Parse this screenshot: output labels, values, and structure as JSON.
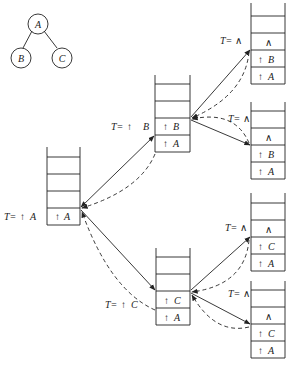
{
  "tree": {
    "nodes": [
      {
        "id": "A",
        "label": "A"
      },
      {
        "id": "B",
        "label": "B"
      },
      {
        "id": "C",
        "label": "C"
      }
    ],
    "edges": [
      [
        "A",
        "B"
      ],
      [
        "A",
        "C"
      ]
    ]
  },
  "stacks": [
    {
      "id": "s1",
      "label": "T=↑ A",
      "cells": [
        "↑ A"
      ]
    },
    {
      "id": "s2",
      "label": "T=↑ B",
      "cells": [
        "↑ A",
        "↑ B"
      ]
    },
    {
      "id": "s3",
      "label": "T=∧",
      "cells": [
        "↑ A",
        "↑ B",
        "∧"
      ]
    },
    {
      "id": "s4",
      "label": "T=∧",
      "cells": [
        "↑ A",
        "↑ B",
        "∧"
      ]
    },
    {
      "id": "s5",
      "label": "T=∧",
      "cells": [
        "↑ A",
        "↑ C",
        "∧"
      ]
    },
    {
      "id": "s6",
      "label": "T=∧",
      "cells": [
        "↑ A",
        "↑ C",
        "∧"
      ]
    },
    {
      "id": "s7",
      "label": "T=↑ C",
      "cells": [
        "↑ A",
        "↑ C"
      ]
    }
  ],
  "labels": {
    "t_prefix": "T=",
    "s1_ptr": "↑",
    "s1_node": "A",
    "s2_ptr": "↑",
    "s2_node": "B",
    "s7_ptr": "↑",
    "s7_node": "C",
    "null_sym": "∧",
    "up": "↑",
    "A": "A",
    "B": "B",
    "C": "C"
  },
  "legend": {
    "solid_arrow": "push / call",
    "dashed_arrow": "return"
  }
}
